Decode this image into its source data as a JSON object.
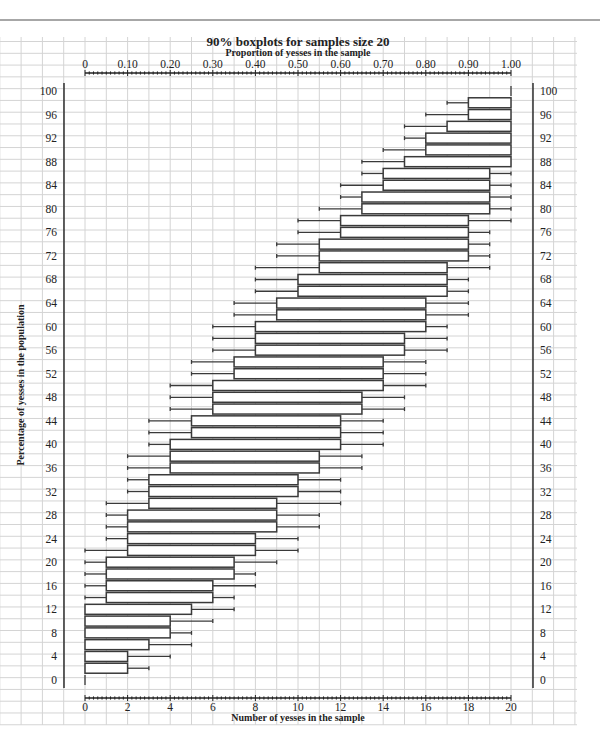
{
  "page": {
    "top_rule": true
  },
  "chart_data": {
    "type": "boxplot",
    "title": "90% boxplots for samples size 20",
    "top_axis_label": "Proportion of yesses in the sample",
    "xlabel": "Number of yesses in the sample",
    "ylabel": "Percentage of yesses in the population",
    "top_axis_ticks": [
      "0",
      "0.10",
      "0.20",
      "0.30",
      "0.40",
      "0.50",
      "0.60",
      "0.70",
      "0.80",
      "0.90",
      "1.00"
    ],
    "bottom_axis_ticks": [
      "0",
      "2",
      "4",
      "6",
      "8",
      "10",
      "12",
      "14",
      "16",
      "18",
      "20"
    ],
    "y_ticks": [
      "0",
      "4",
      "8",
      "12",
      "16",
      "20",
      "24",
      "28",
      "32",
      "36",
      "40",
      "44",
      "48",
      "52",
      "56",
      "60",
      "64",
      "68",
      "72",
      "76",
      "80",
      "84",
      "88",
      "92",
      "96",
      "100"
    ],
    "xlim": [
      0,
      20
    ],
    "ylim": [
      0,
      100
    ],
    "grid": true,
    "colors": {
      "box_stroke": "#3a3a3a",
      "grid": "#d4d4d4",
      "axis": "#222222"
    },
    "note": "Each row: population %, whisker low, box low, box high, whisker high (number of yesses out of 20)",
    "rows": [
      {
        "p": 0,
        "wl": 0,
        "bl": 0,
        "bh": 0,
        "wh": 0
      },
      {
        "p": 2,
        "wl": 0,
        "bl": 0,
        "bh": 2,
        "wh": 3
      },
      {
        "p": 4,
        "wl": 0,
        "bl": 0,
        "bh": 2,
        "wh": 4
      },
      {
        "p": 6,
        "wl": 0,
        "bl": 0,
        "bh": 3,
        "wh": 5
      },
      {
        "p": 8,
        "wl": 0,
        "bl": 0,
        "bh": 4,
        "wh": 5
      },
      {
        "p": 10,
        "wl": 0,
        "bl": 0,
        "bh": 4,
        "wh": 6
      },
      {
        "p": 12,
        "wl": 0,
        "bl": 0,
        "bh": 5,
        "wh": 7
      },
      {
        "p": 14,
        "wl": 0,
        "bl": 1,
        "bh": 6,
        "wh": 7
      },
      {
        "p": 16,
        "wl": 0,
        "bl": 1,
        "bh": 6,
        "wh": 8
      },
      {
        "p": 18,
        "wl": 0,
        "bl": 1,
        "bh": 7,
        "wh": 8
      },
      {
        "p": 20,
        "wl": 0,
        "bl": 1,
        "bh": 7,
        "wh": 9
      },
      {
        "p": 22,
        "wl": 0,
        "bl": 2,
        "bh": 8,
        "wh": 10
      },
      {
        "p": 24,
        "wl": 1,
        "bl": 2,
        "bh": 8,
        "wh": 10
      },
      {
        "p": 26,
        "wl": 1,
        "bl": 2,
        "bh": 9,
        "wh": 11
      },
      {
        "p": 28,
        "wl": 1,
        "bl": 2,
        "bh": 9,
        "wh": 11
      },
      {
        "p": 30,
        "wl": 1,
        "bl": 3,
        "bh": 9,
        "wh": 12
      },
      {
        "p": 32,
        "wl": 2,
        "bl": 3,
        "bh": 10,
        "wh": 12
      },
      {
        "p": 34,
        "wl": 2,
        "bl": 3,
        "bh": 10,
        "wh": 12
      },
      {
        "p": 36,
        "wl": 2,
        "bl": 4,
        "bh": 11,
        "wh": 13
      },
      {
        "p": 38,
        "wl": 2,
        "bl": 4,
        "bh": 11,
        "wh": 13
      },
      {
        "p": 40,
        "wl": 3,
        "bl": 4,
        "bh": 12,
        "wh": 14
      },
      {
        "p": 42,
        "wl": 3,
        "bl": 5,
        "bh": 12,
        "wh": 14
      },
      {
        "p": 44,
        "wl": 3,
        "bl": 5,
        "bh": 12,
        "wh": 14
      },
      {
        "p": 46,
        "wl": 4,
        "bl": 6,
        "bh": 13,
        "wh": 15
      },
      {
        "p": 48,
        "wl": 4,
        "bl": 6,
        "bh": 13,
        "wh": 15
      },
      {
        "p": 50,
        "wl": 4,
        "bl": 6,
        "bh": 14,
        "wh": 16
      },
      {
        "p": 52,
        "wl": 5,
        "bl": 7,
        "bh": 14,
        "wh": 16
      },
      {
        "p": 54,
        "wl": 5,
        "bl": 7,
        "bh": 14,
        "wh": 16
      },
      {
        "p": 56,
        "wl": 6,
        "bl": 8,
        "bh": 15,
        "wh": 17
      },
      {
        "p": 58,
        "wl": 6,
        "bl": 8,
        "bh": 15,
        "wh": 17
      },
      {
        "p": 60,
        "wl": 6,
        "bl": 8,
        "bh": 16,
        "wh": 17
      },
      {
        "p": 62,
        "wl": 7,
        "bl": 9,
        "bh": 16,
        "wh": 18
      },
      {
        "p": 64,
        "wl": 7,
        "bl": 9,
        "bh": 16,
        "wh": 18
      },
      {
        "p": 66,
        "wl": 8,
        "bl": 10,
        "bh": 17,
        "wh": 18
      },
      {
        "p": 68,
        "wl": 8,
        "bl": 10,
        "bh": 17,
        "wh": 18
      },
      {
        "p": 70,
        "wl": 8,
        "bl": 11,
        "bh": 17,
        "wh": 19
      },
      {
        "p": 72,
        "wl": 9,
        "bl": 11,
        "bh": 18,
        "wh": 19
      },
      {
        "p": 74,
        "wl": 9,
        "bl": 11,
        "bh": 18,
        "wh": 19
      },
      {
        "p": 76,
        "wl": 10,
        "bl": 12,
        "bh": 18,
        "wh": 19
      },
      {
        "p": 78,
        "wl": 10,
        "bl": 12,
        "bh": 18,
        "wh": 20
      },
      {
        "p": 80,
        "wl": 11,
        "bl": 13,
        "bh": 19,
        "wh": 20
      },
      {
        "p": 82,
        "wl": 12,
        "bl": 13,
        "bh": 19,
        "wh": 20
      },
      {
        "p": 84,
        "wl": 12,
        "bl": 14,
        "bh": 19,
        "wh": 20
      },
      {
        "p": 86,
        "wl": 13,
        "bl": 14,
        "bh": 19,
        "wh": 20
      },
      {
        "p": 88,
        "wl": 13,
        "bl": 15,
        "bh": 20,
        "wh": 20
      },
      {
        "p": 90,
        "wl": 14,
        "bl": 16,
        "bh": 20,
        "wh": 20
      },
      {
        "p": 92,
        "wl": 15,
        "bl": 16,
        "bh": 20,
        "wh": 20
      },
      {
        "p": 94,
        "wl": 15,
        "bl": 17,
        "bh": 20,
        "wh": 20
      },
      {
        "p": 96,
        "wl": 16,
        "bl": 18,
        "bh": 20,
        "wh": 20
      },
      {
        "p": 98,
        "wl": 17,
        "bl": 18,
        "bh": 20,
        "wh": 20
      },
      {
        "p": 100,
        "wl": 20,
        "bl": 20,
        "bh": 20,
        "wh": 20
      }
    ]
  }
}
